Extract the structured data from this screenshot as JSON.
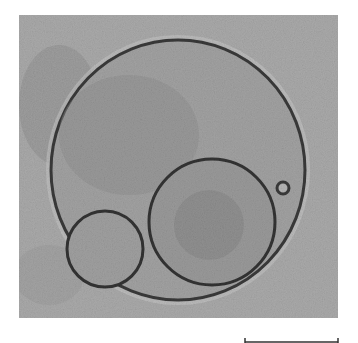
{
  "figure": {
    "kind": "phase-contrast micrograph",
    "background_color": "#a9a9a9",
    "outline_color": "#3a3a3a",
    "objects": [
      {
        "name": "outer-vesicle",
        "cx": 159,
        "cy": 155,
        "rx": 127,
        "ry": 130
      },
      {
        "name": "inner-vesicle-large",
        "cx": 193,
        "cy": 207,
        "r": 63
      },
      {
        "name": "inner-vesicle-small",
        "cx": 86,
        "cy": 234,
        "r": 38
      },
      {
        "name": "tiny-vesicle",
        "cx": 264,
        "cy": 173,
        "r": 6
      }
    ]
  },
  "scale_bar": {
    "label": ""
  }
}
